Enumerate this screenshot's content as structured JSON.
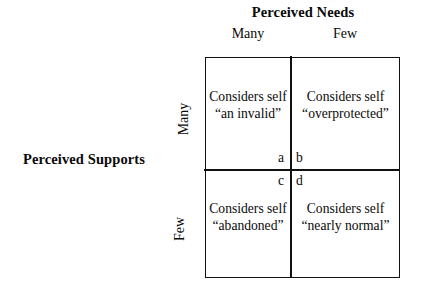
{
  "figure": {
    "type": "2x2-matrix",
    "column_axis": {
      "title": "Perceived Needs",
      "headers": [
        "Many",
        "Few"
      ]
    },
    "row_axis": {
      "title": "Perceived Supports",
      "headers": [
        "Many",
        "Few"
      ]
    },
    "quadrants": [
      {
        "letter": "a",
        "row": "Many",
        "column": "Many",
        "line1": "Considers self",
        "line2": "“an invalid”"
      },
      {
        "letter": "b",
        "row": "Many",
        "column": "Few",
        "line1": "Considers self",
        "line2": "“overprotected”"
      },
      {
        "letter": "c",
        "row": "Few",
        "column": "Many",
        "line1": "Considers self",
        "line2": "“abandoned”"
      },
      {
        "letter": "d",
        "row": "Few",
        "column": "Few",
        "line1": "Considers self",
        "line2": "“nearly normal”"
      }
    ],
    "colors": {
      "background": "#ffffff",
      "ink": "#0a0a0a",
      "rule": "#111111"
    }
  }
}
